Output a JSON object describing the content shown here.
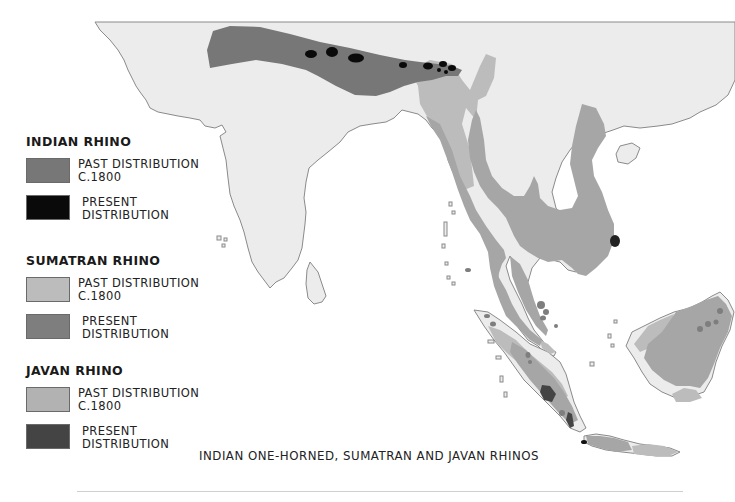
{
  "map": {
    "title": "INDIAN ONE-HORNED, SUMATRAN AND JAVAN RHINOS",
    "colors": {
      "sea": "#ffffff",
      "land": "#ececec",
      "coastline": "#8a8a8a",
      "indian_past": "#777777",
      "indian_present": "#0a0a0a",
      "sumatran_past": "#bcbcbc",
      "sumatran_present": "#8a8a8a",
      "javan_past": "#adadad",
      "javan_present": "#454545"
    },
    "regions_shown": [
      "Indian subcontinent",
      "Sri Lanka",
      "Southeast Asia mainland",
      "Sumatra",
      "Borneo",
      "Java",
      "Hainan",
      "Andaman and Nicobar Islands",
      "Maldives"
    ]
  },
  "legend": [
    {
      "title": "INDIAN RHINO",
      "items": [
        {
          "label_line1": "PAST DISTRIBUTION",
          "label_line2": "C.1800",
          "color": "#777777"
        },
        {
          "label_line1": "PRESENT",
          "label_line2": "DISTRIBUTION",
          "color": "#0a0a0a"
        }
      ]
    },
    {
      "title": "SUMATRAN RHINO",
      "items": [
        {
          "label_line1": "PAST DISTRIBUTION",
          "label_line2": "C.1800",
          "color": "#bcbcbc"
        },
        {
          "label_line1": "PRESENT",
          "label_line2": "DISTRIBUTION",
          "color": "#7e7e7e"
        }
      ]
    },
    {
      "title": "JAVAN RHINO",
      "items": [
        {
          "label_line1": "PAST DISTRIBUTION",
          "label_line2": "C.1800",
          "color": "#b2b2b2"
        },
        {
          "label_line1": "PRESENT",
          "label_line2": "DISTRIBUTION",
          "color": "#444444"
        }
      ]
    }
  ]
}
